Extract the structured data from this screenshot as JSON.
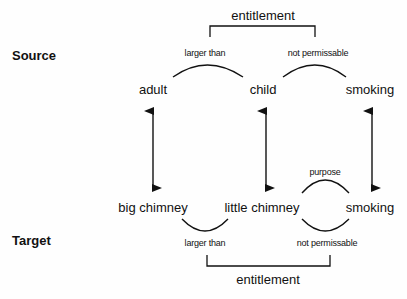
{
  "diagram": {
    "type": "analogy-mapping",
    "rows": {
      "source": {
        "label": "Source",
        "nodes": [
          "adult",
          "child",
          "smoking"
        ],
        "relations": [
          {
            "label": "larger than",
            "from": "adult",
            "to": "child"
          },
          {
            "label": "not permissable",
            "from": "child",
            "to": "smoking"
          }
        ],
        "higher_relation": {
          "label": "entitlement",
          "spans": [
            "larger than",
            "not permissable"
          ]
        }
      },
      "target": {
        "label": "Target",
        "nodes": [
          "big chimney",
          "little chimney",
          "smoking"
        ],
        "relations": [
          {
            "label": "larger than",
            "from": "big chimney",
            "to": "little chimney"
          },
          {
            "label": "purpose",
            "from": "little chimney",
            "to": "smoking"
          },
          {
            "label": "not permissable",
            "from": "little chimney",
            "to": "smoking"
          }
        ],
        "higher_relation": {
          "label": "entitlement",
          "spans": [
            "larger than",
            "not permissable"
          ]
        }
      }
    },
    "mappings": [
      {
        "source": "adult",
        "target": "big chimney"
      },
      {
        "source": "child",
        "target": "little chimney"
      },
      {
        "source": "smoking",
        "target": "smoking"
      }
    ]
  },
  "labels": {
    "source": "Source",
    "target": "Target",
    "top_entitlement": "entitlement",
    "top_larger_than": "larger than",
    "top_not_permissable": "not permissable",
    "src_adult": "adult",
    "src_child": "child",
    "src_smoking": "smoking",
    "purpose": "purpose",
    "tgt_big_chimney": "big chimney",
    "tgt_little_chimney": "little chimney",
    "tgt_smoking": "smoking",
    "bottom_larger_than": "larger than",
    "bottom_not_permissable": "not permissable",
    "bottom_entitlement": "entitlement"
  },
  "colors": {
    "ink": "#111111",
    "background": "#fefefe"
  }
}
